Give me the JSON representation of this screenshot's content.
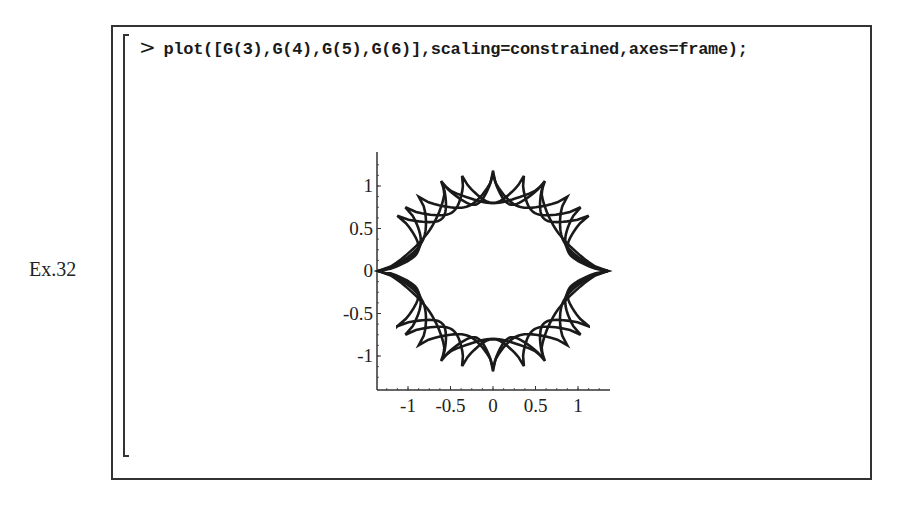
{
  "example_label": "Ex.32",
  "worksheet": {
    "prompt": ">",
    "command": "plot([G(3),G(4),G(5),G(6)],scaling=constrained,axes=frame);"
  },
  "colors": {
    "curve": "#1a1a1a",
    "frame": "#333333",
    "background": "#ffffff"
  },
  "chart_data": {
    "type": "line",
    "title": "",
    "xlabel": "",
    "ylabel": "",
    "axes": "frame",
    "scaling": "constrained",
    "grid": false,
    "legend": null,
    "xlim": [
      -1.37,
      1.37
    ],
    "ylim": [
      -1.4,
      1.4
    ],
    "x_ticks": [
      -1,
      -0.5,
      0,
      0.5,
      1
    ],
    "x_tick_labels": [
      "-1",
      "-0.5",
      "0",
      "0.5",
      "1"
    ],
    "y_ticks": [
      -1,
      -0.5,
      0,
      0.5,
      1
    ],
    "y_tick_labels": [
      "-1",
      "-0.5",
      "0",
      "0.5",
      "1"
    ],
    "series": [
      {
        "name": "G(3)",
        "cusps": 3,
        "shared_cusps": [
          [
            1.35,
            0
          ],
          [
            -1.35,
            0
          ]
        ]
      },
      {
        "name": "G(4)",
        "cusps": 4,
        "shared_cusps": [
          [
            1.35,
            0
          ],
          [
            -1.35,
            0
          ]
        ]
      },
      {
        "name": "G(5)",
        "cusps": 5,
        "shared_cusps": [
          [
            1.35,
            0
          ],
          [
            -1.35,
            0
          ]
        ]
      },
      {
        "name": "G(6)",
        "cusps": 6,
        "shared_cusps": [
          [
            1.35,
            0
          ],
          [
            -1.35,
            0
          ]
        ]
      }
    ]
  }
}
